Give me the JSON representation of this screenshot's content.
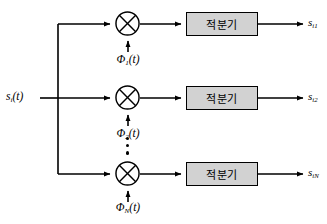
{
  "diagram": {
    "type": "block-diagram",
    "colors": {
      "line": "#000000",
      "box_fill": "#d2d2d2",
      "box_stroke": "#000000",
      "background": "#ffffff"
    },
    "input": {
      "label_base": "s",
      "label_sub": "i",
      "label_tail": "(t)",
      "label_full": "s_i(t)"
    },
    "branches": [
      {
        "id": "branch-1",
        "carrier": {
          "base": "Φ",
          "sub": "1",
          "tail": "(t)",
          "full": "Φ₁(t)"
        },
        "multiplier": "multiply",
        "block_label": "적분기",
        "output": {
          "base": "s",
          "sub": "i1",
          "full": "s_i1"
        }
      },
      {
        "id": "branch-2",
        "carrier": {
          "base": "Φ",
          "sub": "2",
          "tail": "(t)",
          "full": "Φ₂(t)"
        },
        "multiplier": "multiply",
        "block_label": "적분기",
        "output": {
          "base": "s",
          "sub": "i2",
          "full": "s_i2"
        }
      },
      {
        "id": "branch-3",
        "carrier": {
          "base": "Φ",
          "sub": "N",
          "tail": "(t)",
          "full": "Φ_N(t)"
        },
        "multiplier": "multiply",
        "block_label": "적분기",
        "output": {
          "base": "s",
          "sub": "iN",
          "full": "s_iN"
        }
      }
    ],
    "ellipsis": {
      "orientation": "vertical",
      "dot_count": 3,
      "meaning": "additional branches omitted"
    }
  }
}
